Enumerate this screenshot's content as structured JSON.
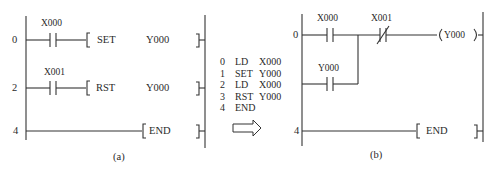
{
  "diagram_a": {
    "caption": "(a)",
    "rungs": [
      {
        "step": "0",
        "contact": "X000",
        "contact_type": "NO",
        "instruction": "SET",
        "operand": "Y000"
      },
      {
        "step": "2",
        "contact": "X001",
        "contact_type": "NO",
        "instruction": "RST",
        "operand": "Y000"
      },
      {
        "step": "4",
        "instruction": "END"
      }
    ]
  },
  "instruction_list": [
    {
      "step": "0",
      "op": "LD",
      "operand": "X000"
    },
    {
      "step": "1",
      "op": "SET",
      "operand": "Y000"
    },
    {
      "step": "2",
      "op": "LD",
      "operand": "X000"
    },
    {
      "step": "3",
      "op": "RST",
      "operand": "Y000"
    },
    {
      "step": "4",
      "op": "END",
      "operand": ""
    }
  ],
  "arrow": "right-arrow-icon",
  "diagram_b": {
    "caption": "(b)",
    "rungs": [
      {
        "step": "0",
        "contacts": [
          {
            "label": "X000",
            "type": "NO"
          },
          {
            "label": "X001",
            "type": "NC"
          }
        ],
        "parallel_contact": {
          "label": "Y000",
          "type": "NO"
        },
        "coil": "Y000"
      },
      {
        "step": "4",
        "instruction": "END"
      }
    ]
  }
}
